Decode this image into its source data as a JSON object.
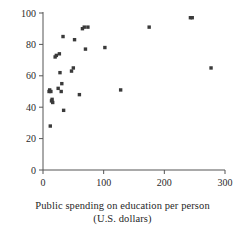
{
  "chart_data": {
    "type": "scatter",
    "title": "",
    "xlabel": "Public spending on education per person (U.S. dollars)",
    "ylabel": "",
    "xlim": [
      0,
      300
    ],
    "ylim": [
      0,
      100
    ],
    "xticks": [
      0,
      100,
      200,
      300
    ],
    "yticks": [
      0,
      20,
      40,
      60,
      80,
      100
    ],
    "grid": false,
    "legend": null,
    "marker": "square",
    "marker_color": "#3a3a3a",
    "points": [
      {
        "x": 12,
        "y": 28
      },
      {
        "x": 10,
        "y": 50
      },
      {
        "x": 11,
        "y": 51
      },
      {
        "x": 13,
        "y": 50
      },
      {
        "x": 14,
        "y": 44
      },
      {
        "x": 15,
        "y": 45
      },
      {
        "x": 16,
        "y": 43
      },
      {
        "x": 20,
        "y": 72
      },
      {
        "x": 22,
        "y": 73
      },
      {
        "x": 25,
        "y": 52
      },
      {
        "x": 27,
        "y": 74
      },
      {
        "x": 28,
        "y": 62
      },
      {
        "x": 30,
        "y": 50
      },
      {
        "x": 31,
        "y": 55
      },
      {
        "x": 33,
        "y": 85
      },
      {
        "x": 34,
        "y": 38
      },
      {
        "x": 47,
        "y": 63
      },
      {
        "x": 50,
        "y": 65
      },
      {
        "x": 52,
        "y": 83
      },
      {
        "x": 60,
        "y": 48
      },
      {
        "x": 65,
        "y": 90
      },
      {
        "x": 68,
        "y": 91
      },
      {
        "x": 70,
        "y": 77
      },
      {
        "x": 74,
        "y": 91
      },
      {
        "x": 102,
        "y": 78
      },
      {
        "x": 128,
        "y": 51
      },
      {
        "x": 175,
        "y": 91
      },
      {
        "x": 243,
        "y": 97
      },
      {
        "x": 246,
        "y": 97
      },
      {
        "x": 277,
        "y": 65
      }
    ],
    "caption": {
      "line1": "Public spending on education per person",
      "line2": "(U.S. dollars)"
    }
  }
}
